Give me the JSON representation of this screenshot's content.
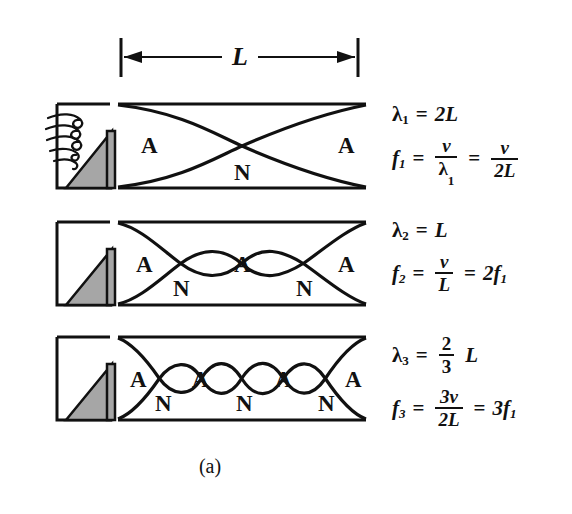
{
  "figure": {
    "caption": "(a)",
    "dimension_label": "L",
    "antinode_symbol": "A",
    "node_symbol": "N",
    "colors": {
      "ink": "#111111",
      "wedge_fill": "#a6a6a6",
      "background": "#ffffff"
    }
  },
  "harmonics": [
    {
      "id": "first-harmonic",
      "order": 1,
      "antinodes": 2,
      "nodes": 1,
      "antinode_labels": [
        "A",
        "A"
      ],
      "node_labels": [
        "N"
      ],
      "wavelength": {
        "symbol": "λ",
        "subscript": "1",
        "value": "2L"
      },
      "frequency": {
        "symbol": "f",
        "subscript": "1",
        "expr1_num": "v",
        "expr1_den": "λ",
        "expr1_den_sub": "1",
        "expr2_num": "v",
        "expr2_den": "2L"
      }
    },
    {
      "id": "second-harmonic",
      "order": 2,
      "antinodes": 3,
      "nodes": 2,
      "antinode_labels": [
        "A",
        "A",
        "A"
      ],
      "node_labels": [
        "N",
        "N"
      ],
      "wavelength": {
        "symbol": "λ",
        "subscript": "2",
        "value": "L"
      },
      "frequency": {
        "symbol": "f",
        "subscript": "2",
        "expr1_num": "v",
        "expr1_den": "L",
        "expr2": "2f",
        "expr2_sub": "1"
      }
    },
    {
      "id": "third-harmonic",
      "order": 3,
      "antinodes": 4,
      "nodes": 3,
      "antinode_labels": [
        "A",
        "A",
        "A",
        "A"
      ],
      "node_labels": [
        "N",
        "N",
        "N"
      ],
      "wavelength": {
        "symbol": "λ",
        "subscript": "3",
        "frac_num": "2",
        "frac_den": "3",
        "value": "L"
      },
      "frequency": {
        "symbol": "f",
        "subscript": "3",
        "expr1_num": "3v",
        "expr1_den": "2L",
        "expr2": "3f",
        "expr2_sub": "1"
      }
    }
  ]
}
